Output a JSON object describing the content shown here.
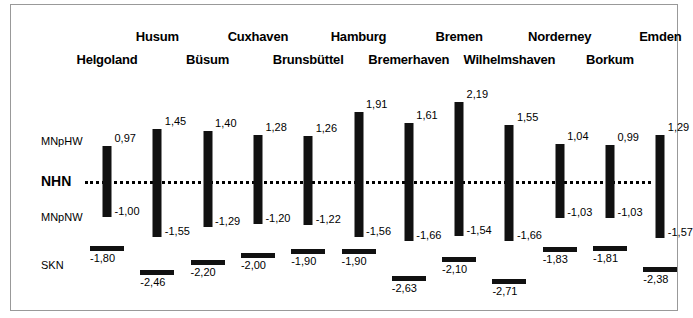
{
  "figure": {
    "datum_line_name": "NHN",
    "axis_labels": [
      {
        "id": "mnphw",
        "text": "MNpHW"
      },
      {
        "id": "nhn",
        "text": "NHN"
      },
      {
        "id": "mnpnw",
        "text": "MNpNW"
      },
      {
        "id": "skn",
        "text": "SKN"
      }
    ]
  },
  "chart_data": {
    "type": "bar",
    "title": "",
    "xlabel": "",
    "ylabel": "",
    "ylim": [
      -2.9,
      2.4
    ],
    "grid": false,
    "legend": "none",
    "datum": {
      "label": "NHN",
      "value": 0.0
    },
    "categories": [
      "Helgoland",
      "Husum",
      "Büsum",
      "Cuxhaven",
      "Brunsbüttel",
      "Hamburg",
      "Bremerhaven",
      "Bremen",
      "Wilhelmshaven",
      "Norderney",
      "Borkum",
      "Emden"
    ],
    "series": [
      {
        "name": "MNpHW",
        "values": [
          0.97,
          1.45,
          1.4,
          1.28,
          1.26,
          1.91,
          1.61,
          2.19,
          1.55,
          1.04,
          0.99,
          1.29
        ]
      },
      {
        "name": "MNpNW",
        "values": [
          -1.0,
          -1.55,
          -1.29,
          -1.2,
          -1.22,
          -1.56,
          -1.66,
          -1.54,
          -1.66,
          -1.03,
          -1.03,
          -1.57
        ]
      },
      {
        "name": "SKN",
        "values": [
          -1.8,
          -2.46,
          -2.2,
          -2.0,
          -1.9,
          -1.9,
          -2.63,
          -2.1,
          -2.71,
          -1.83,
          -1.81,
          -2.38
        ]
      }
    ],
    "labels": {
      "mnphw": [
        "0,97",
        "1,45",
        "1,40",
        "1,28",
        "1,26",
        "1,91",
        "1,61",
        "2,19",
        "1,55",
        "1,04",
        "0,99",
        "1,29"
      ],
      "mnpnw": [
        "-1,00",
        "-1,55",
        "-1,29",
        "-1,20",
        "-1,22",
        "-1,56",
        "-1,66",
        "-1,54",
        "-1,66",
        "-1,03",
        "-1,03",
        "-1,57"
      ],
      "skn": [
        "-1,80",
        "-2,46",
        "-2,20",
        "-2,00",
        "-1,90",
        "-1,90",
        "-2,63",
        "-2,10",
        "-2,71",
        "-1,83",
        "-1,81",
        "-2,38"
      ]
    },
    "label_row": [
      1,
      0,
      1,
      0,
      1,
      0,
      1,
      0,
      1,
      0,
      1,
      0
    ]
  },
  "colors": {
    "bar": "#111111",
    "text": "#000000",
    "frame": "#999999",
    "background": "#ffffff"
  }
}
